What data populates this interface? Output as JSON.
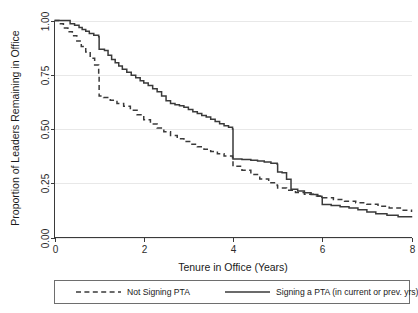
{
  "chart_data": {
    "type": "line",
    "title": "",
    "subtitle": "",
    "xlabel": "Tenure in Office (Years)",
    "ylabel": "Proportion of Leaders Remaining in Office",
    "xlim": [
      0,
      8
    ],
    "ylim": [
      0,
      1
    ],
    "xticks": [
      0,
      2,
      4,
      6,
      8
    ],
    "xtick_labels": [
      "0",
      "2",
      "4",
      "6",
      "8"
    ],
    "yticks": [
      0.0,
      0.25,
      0.5,
      0.75,
      1.0
    ],
    "ytick_labels": [
      "0.00",
      "0.25",
      "0.50",
      "0.75",
      "1.00"
    ],
    "grid": "horizontal",
    "legend_position": "below-plot",
    "style": "kaplan-meier-step",
    "line_color": "#3a3a3a",
    "grid_color": "#e8e8e8",
    "background_color": "#ffffff",
    "series": [
      {
        "name": "Not Signing PTA",
        "dash": "dashed",
        "color": "#3a3a3a",
        "points": [
          [
            0.0,
            1.0
          ],
          [
            0.1,
            0.985
          ],
          [
            0.2,
            0.965
          ],
          [
            0.3,
            0.948
          ],
          [
            0.4,
            0.93
          ],
          [
            0.5,
            0.905
          ],
          [
            0.6,
            0.88
          ],
          [
            0.7,
            0.855
          ],
          [
            0.8,
            0.826
          ],
          [
            0.9,
            0.795
          ],
          [
            0.99,
            0.752
          ],
          [
            1.0,
            0.652
          ],
          [
            1.1,
            0.645
          ],
          [
            1.25,
            0.632
          ],
          [
            1.4,
            0.618
          ],
          [
            1.55,
            0.605
          ],
          [
            1.7,
            0.586
          ],
          [
            1.85,
            0.566
          ],
          [
            2.0,
            0.543
          ],
          [
            2.15,
            0.523
          ],
          [
            2.3,
            0.505
          ],
          [
            2.45,
            0.487
          ],
          [
            2.6,
            0.47
          ],
          [
            2.75,
            0.455
          ],
          [
            2.9,
            0.442
          ],
          [
            3.05,
            0.43
          ],
          [
            3.2,
            0.418
          ],
          [
            3.35,
            0.407
          ],
          [
            3.5,
            0.396
          ],
          [
            3.65,
            0.386
          ],
          [
            3.8,
            0.376
          ],
          [
            3.99,
            0.368
          ],
          [
            4.0,
            0.328
          ],
          [
            4.2,
            0.31
          ],
          [
            4.4,
            0.29
          ],
          [
            4.6,
            0.27
          ],
          [
            4.8,
            0.252
          ],
          [
            4.99,
            0.24
          ],
          [
            5.0,
            0.228
          ],
          [
            5.2,
            0.218
          ],
          [
            5.4,
            0.207
          ],
          [
            5.6,
            0.199
          ],
          [
            5.8,
            0.191
          ],
          [
            6.0,
            0.183
          ],
          [
            6.25,
            0.175
          ],
          [
            6.5,
            0.167
          ],
          [
            6.75,
            0.16
          ],
          [
            7.0,
            0.153
          ],
          [
            7.25,
            0.144
          ],
          [
            7.5,
            0.136
          ],
          [
            7.75,
            0.126
          ],
          [
            8.0,
            0.118
          ]
        ]
      },
      {
        "name": "Signing a PTA (in current or prev. yrs)",
        "dash": "solid",
        "color": "#3a3a3a",
        "points": [
          [
            0.0,
            1.0
          ],
          [
            0.28,
            1.0
          ],
          [
            0.35,
            0.985
          ],
          [
            0.45,
            0.978
          ],
          [
            0.55,
            0.968
          ],
          [
            0.62,
            0.958
          ],
          [
            0.7,
            0.95
          ],
          [
            0.78,
            0.94
          ],
          [
            0.88,
            0.932
          ],
          [
            0.99,
            0.925
          ],
          [
            1.0,
            0.868
          ],
          [
            1.12,
            0.862
          ],
          [
            1.2,
            0.84
          ],
          [
            1.28,
            0.82
          ],
          [
            1.36,
            0.805
          ],
          [
            1.44,
            0.79
          ],
          [
            1.52,
            0.775
          ],
          [
            1.62,
            0.762
          ],
          [
            1.72,
            0.748
          ],
          [
            1.82,
            0.736
          ],
          [
            1.92,
            0.722
          ],
          [
            2.0,
            0.712
          ],
          [
            2.1,
            0.7
          ],
          [
            2.2,
            0.685
          ],
          [
            2.3,
            0.672
          ],
          [
            2.4,
            0.652
          ],
          [
            2.5,
            0.63
          ],
          [
            2.6,
            0.618
          ],
          [
            2.7,
            0.612
          ],
          [
            2.8,
            0.607
          ],
          [
            2.9,
            0.6
          ],
          [
            3.0,
            0.59
          ],
          [
            3.1,
            0.58
          ],
          [
            3.2,
            0.572
          ],
          [
            3.3,
            0.562
          ],
          [
            3.4,
            0.555
          ],
          [
            3.5,
            0.545
          ],
          [
            3.6,
            0.535
          ],
          [
            3.7,
            0.524
          ],
          [
            3.8,
            0.515
          ],
          [
            3.9,
            0.508
          ],
          [
            3.99,
            0.5
          ],
          [
            4.0,
            0.362
          ],
          [
            4.2,
            0.36
          ],
          [
            4.4,
            0.356
          ],
          [
            4.55,
            0.352
          ],
          [
            4.7,
            0.348
          ],
          [
            4.85,
            0.342
          ],
          [
            4.99,
            0.338
          ],
          [
            5.0,
            0.302
          ],
          [
            5.1,
            0.298
          ],
          [
            5.2,
            0.268
          ],
          [
            5.3,
            0.222
          ],
          [
            5.45,
            0.214
          ],
          [
            5.6,
            0.206
          ],
          [
            5.75,
            0.198
          ],
          [
            5.9,
            0.19
          ],
          [
            5.99,
            0.185
          ],
          [
            6.0,
            0.152
          ],
          [
            6.2,
            0.148
          ],
          [
            6.4,
            0.142
          ],
          [
            6.6,
            0.136
          ],
          [
            6.8,
            0.128
          ],
          [
            7.0,
            0.118
          ],
          [
            7.2,
            0.11
          ],
          [
            7.45,
            0.102
          ],
          [
            7.7,
            0.096
          ],
          [
            8.0,
            0.092
          ]
        ]
      }
    ],
    "legend_entries": [
      {
        "label": "Not Signing PTA",
        "dash": "dashed"
      },
      {
        "label": "Signing a PTA (in current or prev. yrs)",
        "dash": "solid"
      }
    ]
  }
}
